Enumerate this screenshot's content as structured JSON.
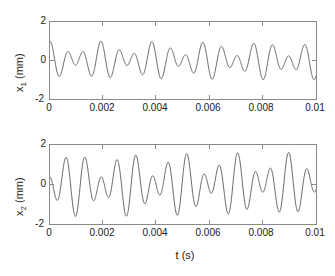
{
  "chart_data": [
    {
      "type": "line",
      "panel_id": "top",
      "title": "",
      "xlabel": "",
      "ylabel": "x_1 (mm)",
      "ylabel_base": "x",
      "ylabel_sub": "1",
      "ylabel_unit": "(mm)",
      "xlim": [
        0,
        0.01
      ],
      "ylim": [
        -2,
        2
      ],
      "xticks": [
        0,
        0.002,
        0.004,
        0.006,
        0.008,
        0.01
      ],
      "xticklabels": [
        "0",
        "0.002",
        "0.004",
        "0.006",
        "0.008",
        "0.01"
      ],
      "yticks": [
        -2,
        0,
        2
      ],
      "yticklabels": [
        "-2",
        "0",
        "2"
      ],
      "grid": false,
      "legend": null,
      "line_color": "#555555",
      "line_width": 0.9,
      "series": [
        {
          "name": "x1",
          "description": "Beating response: superposition of two close modal frequencies",
          "model": "0.62*sin(2*pi*1560*t + 1.62) + 0.38*sin(2*pi*1060*t + 1.50)",
          "components": [
            {
              "amplitude_mm": 0.62,
              "frequency_hz": 1560,
              "phase_rad": 1.62
            },
            {
              "amplitude_mm": 0.38,
              "frequency_hz": 1060,
              "phase_rad": 1.5
            }
          ],
          "n_samples": 1200,
          "peak_amplitude_mm": 1.0,
          "min_amplitude_mm": -1.35,
          "value_at_t0_mm": 1.0
        }
      ]
    },
    {
      "type": "line",
      "panel_id": "bottom",
      "title": "",
      "xlabel": "t (s)",
      "ylabel": "x_2 (mm)",
      "ylabel_base": "x",
      "ylabel_sub": "2",
      "ylabel_unit": "(mm)",
      "xlim": [
        0,
        0.01
      ],
      "ylim": [
        -2,
        2
      ],
      "xticks": [
        0,
        0.002,
        0.004,
        0.006,
        0.008,
        0.01
      ],
      "xticklabels": [
        "0",
        "0.002",
        "0.004",
        "0.006",
        "0.008",
        "0.01"
      ],
      "yticks": [
        -2,
        0,
        2
      ],
      "yticklabels": [
        "-2",
        "0",
        "2"
      ],
      "grid": false,
      "legend": null,
      "line_color": "#555555",
      "line_width": 0.9,
      "series": [
        {
          "name": "x2",
          "description": "Beating response with larger amplitude, antiphase start",
          "model": "1.00*sin(2*pi*1560*t + 1.62) - 0.62*sin(2*pi*1060*t + 1.50)",
          "components": [
            {
              "amplitude_mm": 1.0,
              "frequency_hz": 1560,
              "phase_rad": 1.62
            },
            {
              "amplitude_mm": -0.62,
              "frequency_hz": 1060,
              "phase_rad": 1.5
            }
          ],
          "n_samples": 1200,
          "peak_amplitude_mm": 1.62,
          "min_amplitude_mm": -1.62,
          "value_at_t0_mm": -0.88
        }
      ]
    }
  ],
  "axis_label_bottom": "t (s)"
}
